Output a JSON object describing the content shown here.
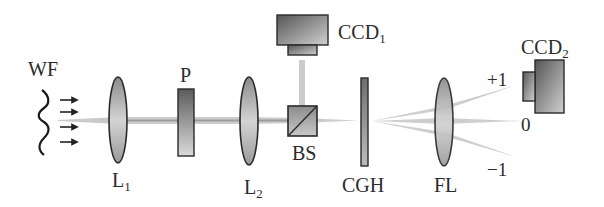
{
  "diagram": {
    "type": "optical-setup",
    "labels": {
      "wf": "WF",
      "l1": "L",
      "l1_sub": "1",
      "p": "P",
      "l2": "L",
      "l2_sub": "2",
      "bs": "BS",
      "ccd1": "CCD",
      "ccd1_sub": "1",
      "cgh": "CGH",
      "fl": "FL",
      "ccd2": "CCD",
      "ccd2_sub": "2",
      "order_plus1": "+1",
      "order_0": "0",
      "order_minus1": "−1"
    },
    "components": [
      {
        "id": "WF",
        "kind": "wavefront"
      },
      {
        "id": "L1",
        "kind": "lens"
      },
      {
        "id": "P",
        "kind": "plate"
      },
      {
        "id": "L2",
        "kind": "lens"
      },
      {
        "id": "BS",
        "kind": "beam-splitter"
      },
      {
        "id": "CCD1",
        "kind": "camera"
      },
      {
        "id": "CGH",
        "kind": "hologram"
      },
      {
        "id": "FL",
        "kind": "lens"
      },
      {
        "id": "CCD2",
        "kind": "camera"
      }
    ],
    "diffraction_orders": [
      "+1",
      "0",
      "−1"
    ],
    "colors": {
      "outline": "#2a2a2a",
      "beam": "#b5b5b5",
      "component_dark": "#6a6a6a",
      "component_light": "#d8d8d8"
    }
  }
}
